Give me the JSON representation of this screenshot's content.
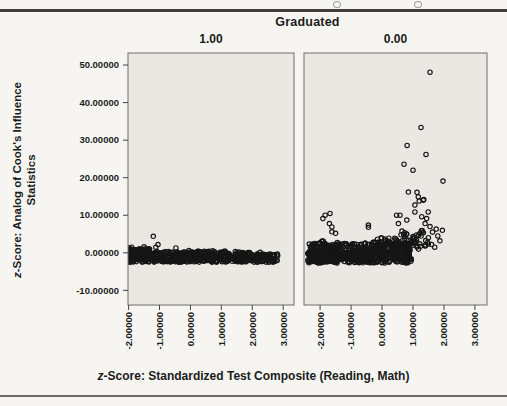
{
  "page": {
    "facet_title": "Graduated"
  },
  "chart_data": {
    "type": "scatter",
    "facet_variable_title": "Graduated",
    "legend_position": "none",
    "grid": false,
    "marker": "open-circle",
    "x_axis": {
      "title_italic_prefix": "z",
      "title_rest": "-Score: Standardized Test Composite (Reading, Math)",
      "ticks": [
        -2,
        -1,
        0,
        1,
        2,
        3
      ],
      "tick_labels": [
        "-2.00000",
        "-1.00000",
        "0.00000",
        "1.00000",
        "2.00000",
        "3.00000"
      ]
    },
    "y_axis": {
      "title_italic_prefix": "z",
      "title_rest": "-Score: Analog of Cook's Influence",
      "title_line2": "Statistics",
      "domain": [
        -13.9,
        53.2
      ],
      "ticks": [
        50,
        40,
        30,
        20,
        10,
        0,
        -10
      ],
      "tick_labels": [
        "50.00000",
        "40.00000",
        "30.00000",
        "20.00000",
        "10.00000",
        "0.00000",
        "-10.00000"
      ]
    },
    "style": {
      "panel_fill": "#e9e8e3",
      "panel_border": "#6f6f6f",
      "tick_color": "#444444",
      "point_color": "#161616",
      "point_radius": 2.2,
      "text_color": "#1c1c1c"
    },
    "panels": [
      {
        "label": "1.00",
        "x_domain": [
          -2.02,
          3.35
        ],
        "dense_clusters": [
          {
            "n": 520,
            "x": [
              -2.02,
              2.82
            ],
            "y": [
              -2.5,
              -0.2
            ]
          },
          {
            "n": 90,
            "x": [
              -2.02,
              -1.3
            ],
            "y": [
              -0.6,
              1.1
            ]
          },
          {
            "n": 60,
            "x": [
              -1.3,
              0.8
            ],
            "y": [
              -0.25,
              0.45
            ]
          },
          {
            "n": 18,
            "x": [
              0.8,
              2.55
            ],
            "y": [
              -0.2,
              0.25
            ]
          }
        ],
        "points": [
          [
            -1.2,
            4.4
          ],
          [
            -1.05,
            2.2
          ],
          [
            -1.5,
            1.6
          ],
          [
            -1.12,
            1.5
          ],
          [
            -0.47,
            1.3
          ],
          [
            -1.9,
            1.5
          ],
          [
            -1.98,
            1.3
          ],
          [
            -0.05,
            0.6
          ],
          [
            0.71,
            0.55
          ],
          [
            1.11,
            0.5
          ],
          [
            1.45,
            0.35
          ],
          [
            2.22,
            -0.5
          ]
        ],
        "high_outliers": []
      },
      {
        "label": "0.00",
        "x_domain": [
          -2.52,
          3.39
        ],
        "dense_clusters": [
          {
            "n": 500,
            "x": [
              -2.4,
              0.95
            ],
            "y": [
              -2.7,
              0.8
            ]
          },
          {
            "n": 130,
            "x": [
              -2.3,
              0.9
            ],
            "y": [
              0.8,
              2.6
            ]
          },
          {
            "n": 70,
            "x": [
              -0.3,
              1.2
            ],
            "y": [
              0.8,
              4.0
            ]
          },
          {
            "n": 35,
            "x": [
              0.6,
              1.55
            ],
            "y": [
              1.5,
              6.0
            ]
          },
          {
            "n": 20,
            "x": [
              -2.35,
              -1.4
            ],
            "y": [
              0.8,
              3.2
            ]
          }
        ],
        "points": [
          [
            -2.16,
            2.5
          ],
          [
            -1.91,
            9.1
          ],
          [
            -1.84,
            10.0
          ],
          [
            -1.68,
            10.5
          ],
          [
            -1.7,
            7.8
          ],
          [
            -1.62,
            6.9
          ],
          [
            -1.62,
            5.6
          ],
          [
            -1.5,
            5.2
          ],
          [
            -0.44,
            7.4
          ],
          [
            -0.44,
            6.8
          ],
          [
            0.47,
            10.0
          ],
          [
            0.53,
            7.8
          ],
          [
            0.58,
            10.0
          ],
          [
            0.8,
            8.7
          ],
          [
            0.85,
            16.2
          ],
          [
            1.13,
            16.1
          ],
          [
            1.06,
            10.9
          ],
          [
            1.06,
            12.7
          ],
          [
            1.17,
            14.9
          ],
          [
            1.2,
            13.8
          ],
          [
            1.28,
            9.6
          ],
          [
            1.33,
            14.0
          ],
          [
            1.35,
            14.2
          ],
          [
            1.39,
            7.8
          ],
          [
            1.44,
            9.1
          ],
          [
            1.49,
            10.9
          ],
          [
            1.55,
            7.0
          ],
          [
            1.63,
            5.5
          ],
          [
            1.75,
            6.3
          ],
          [
            1.8,
            4.5
          ],
          [
            1.95,
            6.0
          ],
          [
            1.87,
            3.2
          ],
          [
            1.6,
            2.2
          ],
          [
            1.7,
            1.5
          ]
        ],
        "high_outliers": [
          [
            1.55,
            48.1
          ],
          [
            1.26,
            33.4
          ],
          [
            0.81,
            28.6
          ],
          [
            1.42,
            26.2
          ],
          [
            0.71,
            23.6
          ],
          [
            1.0,
            22.0
          ],
          [
            1.97,
            19.1
          ]
        ]
      }
    ]
  }
}
